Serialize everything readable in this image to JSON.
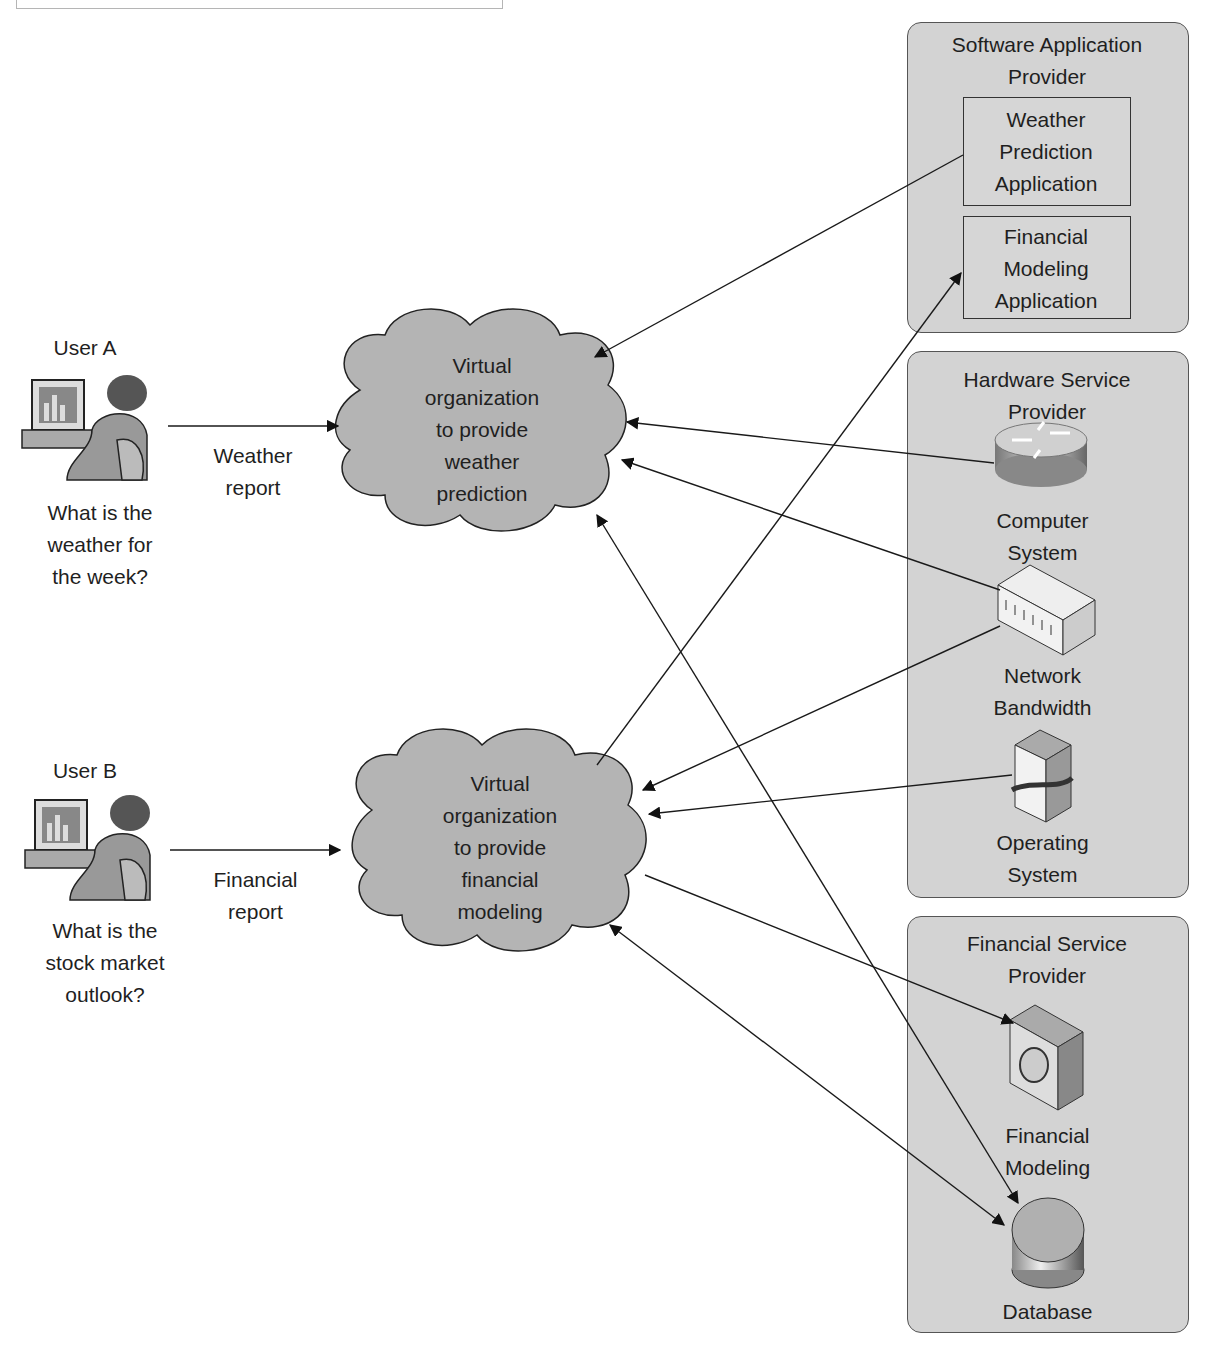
{
  "users": [
    {
      "name": "User A",
      "question": "What is the\nweather for\nthe week?",
      "request": "Weather\nreport"
    },
    {
      "name": "User B",
      "question": "What is the\nstock market\noutlook?",
      "request": "Financial\nreport"
    }
  ],
  "clouds": [
    {
      "label": "Virtual\norganization\nto provide\nweather\nprediction"
    },
    {
      "label": "Virtual\norganization\nto provide\nfinancial\nmodeling"
    }
  ],
  "providers": {
    "software": {
      "title": "Software Application\nProvider",
      "apps": [
        "Weather\nPrediction\nApplication",
        "Financial\nModeling\nApplication"
      ]
    },
    "hardware": {
      "title": "Hardware Service\nProvider",
      "items": [
        "Computer\nSystem",
        "Network\nBandwidth",
        "Operating\nSystem"
      ]
    },
    "financial": {
      "title": "Financial Service\nProvider",
      "items": [
        "Financial\nModeling",
        "Database"
      ]
    }
  },
  "colors": {
    "provider_fill": "#d3d3d3",
    "cloud_fill": "#b4b4b4",
    "line": "#1a1a1a"
  }
}
